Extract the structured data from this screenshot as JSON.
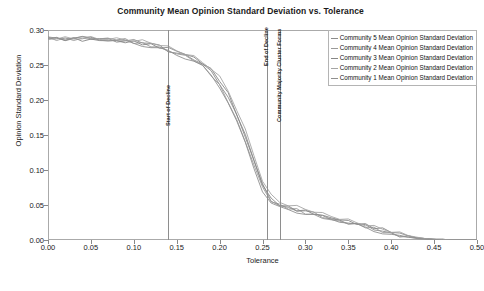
{
  "chart_data": {
    "type": "line",
    "title": "Community Mean Opinion Standard Deviation vs. Tolerance",
    "xlabel": "Tolerance",
    "ylabel": "Opinion Standard Deviation",
    "xlim": [
      0.0,
      0.5
    ],
    "ylim": [
      0.0,
      0.3
    ],
    "xticks": [
      "0.00",
      "0.05",
      "0.10",
      "0.15",
      "0.20",
      "0.25",
      "0.30",
      "0.35",
      "0.40",
      "0.45",
      "0.50"
    ],
    "xtick_values": [
      0.0,
      0.05,
      0.1,
      0.15,
      0.2,
      0.25,
      0.3,
      0.35,
      0.4,
      0.45,
      0.5
    ],
    "yticks": [
      "0.00",
      "0.05",
      "0.10",
      "0.15",
      "0.20",
      "0.25",
      "0.30"
    ],
    "ytick_values": [
      0.0,
      0.05,
      0.1,
      0.15,
      0.2,
      0.25,
      0.3
    ],
    "grid": false,
    "legend_position": "top-right",
    "x": [
      0.0,
      0.01,
      0.02,
      0.03,
      0.04,
      0.05,
      0.06,
      0.07,
      0.08,
      0.09,
      0.1,
      0.11,
      0.12,
      0.13,
      0.14,
      0.15,
      0.16,
      0.17,
      0.18,
      0.19,
      0.2,
      0.21,
      0.22,
      0.23,
      0.24,
      0.25,
      0.26,
      0.27,
      0.28,
      0.29,
      0.3,
      0.31,
      0.32,
      0.33,
      0.34,
      0.35,
      0.36,
      0.37,
      0.38,
      0.39,
      0.4,
      0.41,
      0.42,
      0.43,
      0.44,
      0.45,
      0.46,
      0.47,
      0.48,
      0.49,
      0.5
    ],
    "series": [
      {
        "name": "Community 5 Mean Opinion Standard Deviation",
        "color": "#8c8c8c",
        "values": [
          0.288,
          0.288,
          0.288,
          0.288,
          0.288,
          0.288,
          0.287,
          0.287,
          0.286,
          0.285,
          0.284,
          0.282,
          0.28,
          0.277,
          0.272,
          0.268,
          0.263,
          0.258,
          0.25,
          0.24,
          0.225,
          0.205,
          0.178,
          0.148,
          0.112,
          0.078,
          0.058,
          0.05,
          0.046,
          0.043,
          0.04,
          0.037,
          0.034,
          0.031,
          0.028,
          0.025,
          0.022,
          0.019,
          0.016,
          0.013,
          0.01,
          0.007,
          0.005,
          0.003,
          0.002,
          0.001,
          0.001,
          0.0,
          0.0,
          0.0,
          0.0
        ]
      },
      {
        "name": "Community 4 Mean Opinion Standard Deviation",
        "color": "#9a9a9a",
        "values": [
          0.288,
          0.288,
          0.288,
          0.288,
          0.288,
          0.287,
          0.287,
          0.286,
          0.286,
          0.285,
          0.283,
          0.281,
          0.279,
          0.276,
          0.271,
          0.266,
          0.262,
          0.256,
          0.247,
          0.236,
          0.22,
          0.199,
          0.172,
          0.142,
          0.108,
          0.075,
          0.055,
          0.048,
          0.045,
          0.042,
          0.039,
          0.036,
          0.033,
          0.03,
          0.027,
          0.024,
          0.021,
          0.018,
          0.015,
          0.012,
          0.009,
          0.007,
          0.004,
          0.003,
          0.002,
          0.001,
          0.0,
          0.0,
          0.0,
          0.0,
          0.0
        ]
      },
      {
        "name": "Community 3 Mean Opinion Standard Deviation",
        "color": "#878787",
        "values": [
          0.288,
          0.288,
          0.288,
          0.288,
          0.287,
          0.287,
          0.287,
          0.286,
          0.285,
          0.284,
          0.283,
          0.281,
          0.278,
          0.275,
          0.273,
          0.269,
          0.264,
          0.259,
          0.252,
          0.242,
          0.228,
          0.208,
          0.18,
          0.15,
          0.115,
          0.08,
          0.06,
          0.052,
          0.048,
          0.045,
          0.042,
          0.039,
          0.035,
          0.032,
          0.029,
          0.026,
          0.023,
          0.02,
          0.017,
          0.014,
          0.011,
          0.008,
          0.005,
          0.003,
          0.002,
          0.001,
          0.001,
          0.0,
          0.0,
          0.0,
          0.0
        ]
      },
      {
        "name": "Community 2 Mean Opinion Standard Deviation",
        "color": "#a5a5a5",
        "values": [
          0.288,
          0.288,
          0.288,
          0.288,
          0.288,
          0.288,
          0.287,
          0.287,
          0.286,
          0.286,
          0.284,
          0.283,
          0.281,
          0.278,
          0.274,
          0.27,
          0.265,
          0.26,
          0.253,
          0.244,
          0.231,
          0.212,
          0.185,
          0.155,
          0.12,
          0.084,
          0.062,
          0.053,
          0.049,
          0.046,
          0.043,
          0.04,
          0.036,
          0.033,
          0.03,
          0.027,
          0.024,
          0.021,
          0.018,
          0.015,
          0.012,
          0.009,
          0.006,
          0.004,
          0.002,
          0.001,
          0.001,
          0.0,
          0.0,
          0.0,
          0.0
        ]
      },
      {
        "name": "Community 1 Mean Opinion Standard Deviation",
        "color": "#909090",
        "values": [
          0.288,
          0.288,
          0.288,
          0.288,
          0.287,
          0.287,
          0.286,
          0.286,
          0.285,
          0.284,
          0.282,
          0.28,
          0.277,
          0.274,
          0.27,
          0.265,
          0.26,
          0.254,
          0.246,
          0.234,
          0.218,
          0.196,
          0.168,
          0.138,
          0.104,
          0.072,
          0.054,
          0.047,
          0.044,
          0.041,
          0.038,
          0.035,
          0.032,
          0.029,
          0.026,
          0.023,
          0.02,
          0.017,
          0.014,
          0.011,
          0.008,
          0.006,
          0.004,
          0.002,
          0.001,
          0.001,
          0.0,
          0.0,
          0.0,
          0.0,
          0.0
        ]
      }
    ],
    "annotations": [
      {
        "label": "Start of Decline",
        "x": 0.14
      },
      {
        "label": "End of Decline",
        "x": 0.255
      },
      {
        "label": "Community Majority Cluster Forms",
        "x": 0.27
      }
    ]
  }
}
